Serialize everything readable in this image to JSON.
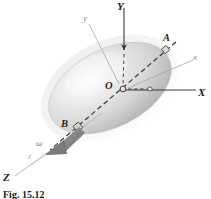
{
  "figure": {
    "caption": "Fig. 15.12",
    "background_color": "#ffffff"
  },
  "colors": {
    "body_fill_light": "#f2f2f2",
    "body_fill_mid": "#d2d2d2",
    "body_fill_dark": "#a8a8a8",
    "axis_dark": "#333333",
    "axis_light": "#a0a0a0",
    "dashed_axis": "#4a4a4a",
    "omega_arrow": "#7a7a7a",
    "label_dark": "#1a1a1a",
    "label_gray": "#8c8c8c",
    "label_faint": "#b4b4b4"
  },
  "labels": [
    {
      "id": "Y-axis-label",
      "text": "Y",
      "kind": "cap",
      "x": 117,
      "y": 3
    },
    {
      "id": "y-body-axis-label",
      "text": "y",
      "kind": "low",
      "x": 83,
      "y": 15
    },
    {
      "id": "A-point-label",
      "text": "A",
      "kind": "pt",
      "x": 163,
      "y": 36
    },
    {
      "id": "x-body-axis-label",
      "text": "x",
      "kind": "low",
      "x": 194,
      "y": 56
    },
    {
      "id": "X-axis-label",
      "text": "X",
      "kind": "cap",
      "x": 199,
      "y": 92
    },
    {
      "id": "O-origin-label",
      "text": "O",
      "kind": "pt",
      "x": 106,
      "y": 83
    },
    {
      "id": "B-point-label",
      "text": "B",
      "kind": "pt",
      "x": 62,
      "y": 122
    },
    {
      "id": "omega-label",
      "text": "ω",
      "kind": "omega",
      "x": 37,
      "y": 143
    },
    {
      "id": "z-body-axis-label",
      "text": "z",
      "kind": "low-faint",
      "x": 28,
      "y": 155
    },
    {
      "id": "Z-axis-label",
      "text": "Z",
      "kind": "cap",
      "x": 3,
      "y": 176
    }
  ],
  "geometry": {
    "origin": {
      "x": 122,
      "y": 90
    },
    "ellipsoid": {
      "center_x": 110,
      "center_y": 88,
      "radius_x": 66,
      "radius_y": 39,
      "rotation_deg": -27
    },
    "X_axis": {
      "x1": 122,
      "y1": 90,
      "x2": 197,
      "y2": 90
    },
    "Y_axis": {
      "x1": 124,
      "y1": 6,
      "x2": 124,
      "y2": 47
    },
    "Z_axis": {
      "x1": 104,
      "y1": 111,
      "x2": 14,
      "y2": 177
    },
    "AB_axis": {
      "ax": 168,
      "ay": 49,
      "bx": 48,
      "by": 152
    },
    "point_A_marker": {
      "x": 166,
      "y": 50
    },
    "point_B_marker": {
      "x": 78,
      "y": 127
    },
    "O_marker": {
      "x": 122,
      "y": 90
    },
    "dashed_right_marker": {
      "x": 150,
      "y": 89
    },
    "omega_arrow_tip": {
      "x": 47,
      "y": 153
    }
  },
  "elements": {
    "ellipsoid_body": "shaded-ellipsoid",
    "rotation_vector": "omega-angular-velocity-arrow",
    "fixed_frame": "XYZ",
    "body_frame": "xyz"
  }
}
